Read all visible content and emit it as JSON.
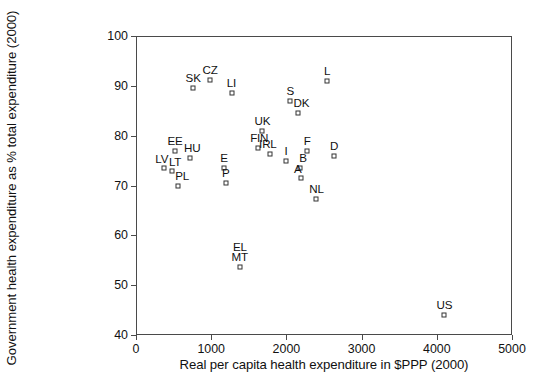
{
  "chart_data": {
    "type": "scatter",
    "title": "",
    "xlabel": "Real per capita health expenditure in $PPP (2000)",
    "ylabel": "Government health expenditure as % total expenditure (2000)",
    "xlim": [
      0,
      5000
    ],
    "ylim": [
      40,
      100
    ],
    "xticks": [
      0,
      1000,
      2000,
      3000,
      4000,
      5000
    ],
    "xtick_labels": [
      "0",
      "1000",
      "2000",
      "3000",
      "4000",
      "5000"
    ],
    "yticks": [
      40,
      50,
      60,
      70,
      80,
      90,
      100
    ],
    "ytick_labels": [
      "40",
      "50",
      "60",
      "70",
      "80",
      "90",
      "100"
    ],
    "grid": false,
    "legend": "none",
    "marker": "open-square",
    "points": [
      {
        "label": "SK",
        "x": 760,
        "y": 89.5,
        "label_dx": 0,
        "label_dy": -4
      },
      {
        "label": "CZ",
        "x": 985,
        "y": 91.2,
        "label_dx": 0,
        "label_dy": -4
      },
      {
        "label": "LI",
        "x": 1270,
        "y": 88.5,
        "label_dx": 0,
        "label_dy": -4
      },
      {
        "label": "L",
        "x": 2540,
        "y": 91.0,
        "label_dx": 0,
        "label_dy": -4
      },
      {
        "label": "S",
        "x": 2050,
        "y": 87.0,
        "label_dx": 0,
        "label_dy": -4
      },
      {
        "label": "DK",
        "x": 2160,
        "y": 84.5,
        "label_dx": 3,
        "label_dy": -4
      },
      {
        "label": "UK",
        "x": 1680,
        "y": 81.0,
        "label_dx": 0,
        "label_dy": -4
      },
      {
        "label": "EE",
        "x": 520,
        "y": 77.0,
        "label_dx": 0,
        "label_dy": -4
      },
      {
        "label": "HU",
        "x": 720,
        "y": 75.5,
        "label_dx": 2,
        "label_dy": -4
      },
      {
        "label": "FIN",
        "x": 1625,
        "y": 77.5,
        "label_dx": 1,
        "label_dy": -4
      },
      {
        "label": "IRL",
        "x": 1780,
        "y": 76.4,
        "label_dx": -2,
        "label_dy": -4
      },
      {
        "label": "F",
        "x": 2275,
        "y": 77.0,
        "label_dx": 0,
        "label_dy": -4
      },
      {
        "label": "D",
        "x": 2635,
        "y": 76.0,
        "label_dx": 0,
        "label_dy": -4
      },
      {
        "label": "LV",
        "x": 370,
        "y": 73.6,
        "label_dx": -2,
        "label_dy": -3
      },
      {
        "label": "LT",
        "x": 480,
        "y": 72.9,
        "label_dx": 3,
        "label_dy": -3
      },
      {
        "label": "E",
        "x": 1170,
        "y": 73.5,
        "label_dx": 0,
        "label_dy": -4
      },
      {
        "label": "I",
        "x": 1995,
        "y": 75.0,
        "label_dx": 0,
        "label_dy": -4
      },
      {
        "label": "B",
        "x": 2180,
        "y": 73.5,
        "label_dx": 3,
        "label_dy": -4
      },
      {
        "label": "PL",
        "x": 560,
        "y": 70.0,
        "label_dx": 4,
        "label_dy": -4
      },
      {
        "label": "P",
        "x": 1195,
        "y": 70.5,
        "label_dx": 0,
        "label_dy": -4
      },
      {
        "label": "A",
        "x": 2190,
        "y": 71.5,
        "label_dx": -3,
        "label_dy": -3
      },
      {
        "label": "NL",
        "x": 2400,
        "y": 67.2,
        "label_dx": 0,
        "label_dy": -4
      },
      {
        "label": "EL",
        "x": 1380,
        "y": 53.6,
        "label_dx": 0,
        "label_dy": -14,
        "hide_marker": true
      },
      {
        "label": "MT",
        "x": 1380,
        "y": 53.6,
        "label_dx": 0,
        "label_dy": -4
      },
      {
        "label": "US",
        "x": 4100,
        "y": 44.0,
        "label_dx": 0,
        "label_dy": -4
      }
    ]
  },
  "axes": {
    "x_title": "Real per capita health expenditure in $PPP (2000)",
    "y_title": "Government health expenditure as % total expenditure (2000)"
  },
  "colors": {
    "axis": "#4a4a4a",
    "marker_edge": "#333333",
    "marker_fill": "#ffffff",
    "text": "#111111",
    "background": "#ffffff"
  }
}
